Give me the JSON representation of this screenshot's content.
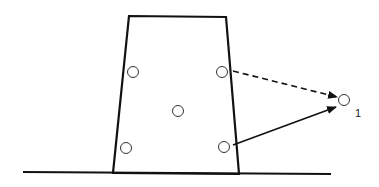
{
  "diagram": {
    "width": 379,
    "height": 187,
    "stroke_color": "#111111",
    "block": {
      "shape": "trapezoid",
      "top_left": [
        129,
        16
      ],
      "top_right": [
        226,
        17
      ],
      "bottom_right": [
        239,
        174
      ],
      "bottom_left": [
        113,
        173
      ]
    },
    "ground": {
      "x1": 23,
      "y1": 172,
      "x2": 331,
      "y2": 174
    },
    "points": [
      {
        "id": "upper-left",
        "cx": 133,
        "cy": 72,
        "r": 5.5
      },
      {
        "id": "upper-right",
        "cx": 222,
        "cy": 72,
        "r": 5.5
      },
      {
        "id": "center",
        "cx": 178,
        "cy": 111,
        "r": 5.5
      },
      {
        "id": "lower-left",
        "cx": 126,
        "cy": 148,
        "r": 5.5
      },
      {
        "id": "lower-right",
        "cx": 224,
        "cy": 147,
        "r": 5.5
      },
      {
        "id": "target",
        "cx": 344,
        "cy": 100,
        "r": 5.5
      }
    ],
    "arrows": [
      {
        "id": "dashed-arrow",
        "style": "dashed",
        "x1": 233,
        "y1": 71,
        "x2": 337,
        "y2": 97
      },
      {
        "id": "solid-arrow",
        "style": "solid",
        "x1": 233,
        "y1": 145,
        "x2": 336,
        "y2": 107
      }
    ],
    "labels": [
      {
        "id": "target-label",
        "text": "1",
        "x": 355,
        "y": 117
      }
    ]
  }
}
